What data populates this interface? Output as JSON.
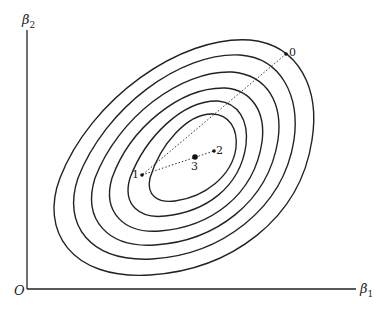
{
  "axes": {
    "x_label": "β",
    "x_sub": "1",
    "y_label": "β",
    "y_sub": "2",
    "origin_label": "O"
  },
  "points": [
    {
      "label": "0",
      "x": 286,
      "y": 54
    },
    {
      "label": "1",
      "x": 142,
      "y": 175
    },
    {
      "label": "2",
      "x": 214,
      "y": 151
    },
    {
      "label": "3",
      "x": 195,
      "y": 157
    }
  ],
  "contours": {
    "count": 6,
    "center": [
      195,
      157
    ],
    "rotation_deg": -42
  },
  "colors": {
    "line": "#222222",
    "background": "#ffffff"
  }
}
